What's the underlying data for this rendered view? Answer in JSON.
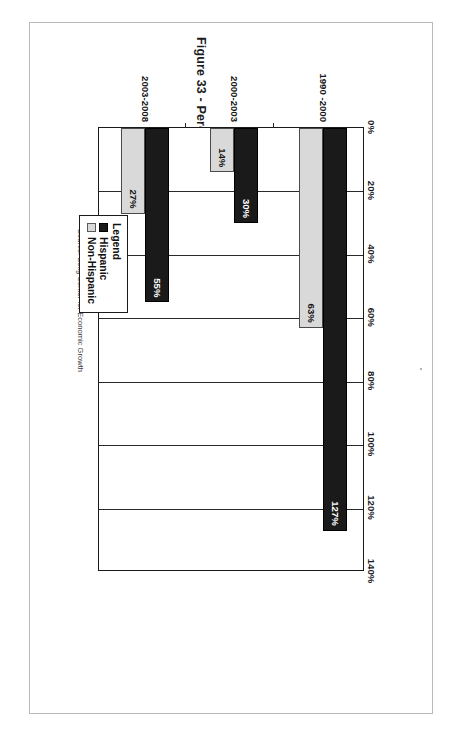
{
  "page": {
    "figure_title": "Figure 33 - Percentage Growth in Buying Power 1990 to 2008",
    "source_note": "Source: Selig Center for Economic Growth"
  },
  "legend": {
    "title": "Legend",
    "items": [
      {
        "label": "Hispanic",
        "swatch": "dark",
        "color": "#1a1a1a"
      },
      {
        "label": "Non-Hispanic",
        "swatch": "light",
        "color": "#d9d9d9"
      }
    ]
  },
  "chart_data": {
    "type": "bar",
    "orientation": "horizontal",
    "title": "Figure 33 - Percentage Growth in Buying Power 1990 to 2008",
    "xlabel": "",
    "ylabel": "",
    "categories": [
      "1990 -2000",
      "2000-2003",
      "2003-2008"
    ],
    "series": [
      {
        "name": "Hispanic",
        "color": "#1a1a1a",
        "values": [
          127,
          30,
          55
        ],
        "labels": [
          "127%",
          "30%",
          "55%"
        ]
      },
      {
        "name": "Non-Hispanic",
        "color": "#d9d9d9",
        "values": [
          63,
          14,
          27
        ],
        "labels": [
          "63%",
          "14%",
          "27%"
        ]
      }
    ],
    "xlim": [
      0,
      140
    ],
    "tick_labels": [
      "0%",
      "20%",
      "40%",
      "60%",
      "80%",
      "100%",
      "120%",
      "140%"
    ],
    "tick_values": [
      0,
      20,
      40,
      60,
      80,
      100,
      120,
      140
    ],
    "grid": true,
    "legend_position": "below-right",
    "source": "Source: Selig Center for Economic Growth"
  }
}
